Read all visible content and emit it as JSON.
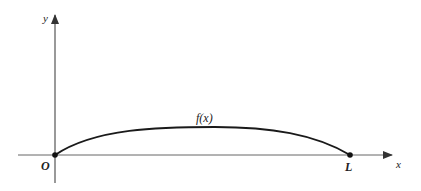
{
  "diagram": {
    "labels": {
      "y_axis": "y",
      "x_axis": "x",
      "origin": "O",
      "endpoint": "L",
      "curve": "f(x)"
    },
    "colors": {
      "axis": "#555555",
      "curve": "#1a1a1a",
      "text": "#222222"
    }
  }
}
